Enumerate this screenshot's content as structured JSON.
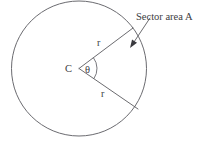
{
  "figure": {
    "background_color": "#ffffff",
    "line_color": "#5a5a5f",
    "text_color": "#3c3c41",
    "labels": {
      "sector_area": "Sector area A",
      "center": "C",
      "angle": "θ",
      "radius_upper": "r",
      "radius_lower": "r"
    },
    "geometry": {
      "circle_center_x": 79,
      "circle_center_y": 68.5,
      "circle_radius": 67.5,
      "sector_vertex_x": 79,
      "sector_vertex_y": 68.5,
      "upper_radius_end_x": 133,
      "upper_radius_end_y": 28,
      "lower_radius_end_x": 138,
      "lower_radius_end_y": 109,
      "angle_arc_radius": 18,
      "arrow_tail_x": 150,
      "arrow_tail_y": 18,
      "arrow_tip_x": 130,
      "arrow_tip_y": 48
    },
    "label_positions": {
      "sector_area_x": 136,
      "sector_area_y": 20,
      "center_x": 65,
      "center_y": 72,
      "angle_x": 85,
      "angle_y": 73,
      "radius_upper_x": 97,
      "radius_upper_y": 46,
      "radius_lower_x": 101,
      "radius_lower_y": 97
    }
  }
}
